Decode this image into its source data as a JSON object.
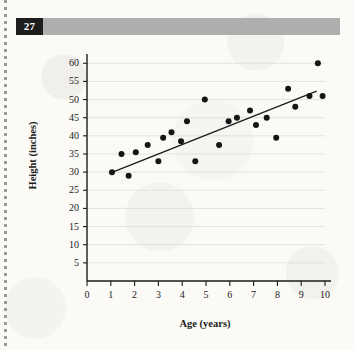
{
  "page": {
    "number": "27"
  },
  "chart_data": {
    "type": "scatter",
    "title": "",
    "xlabel": "Age (years)",
    "ylabel": "Height (inches)",
    "xlim": [
      0,
      10
    ],
    "ylim": [
      0,
      62
    ],
    "xticks": [
      0,
      1,
      2,
      3,
      4,
      5,
      6,
      7,
      8,
      9,
      10
    ],
    "xtick_labels": [
      "0",
      "1",
      "2",
      "3",
      "4",
      "5",
      "6",
      "7",
      "8",
      "9",
      "10"
    ],
    "yticks": [
      5,
      10,
      15,
      20,
      25,
      30,
      35,
      40,
      45,
      50,
      55,
      60
    ],
    "ytick_labels": [
      "5",
      "10",
      "15",
      "20",
      "25",
      "30",
      "35",
      "40",
      "45",
      "50",
      "55",
      "60"
    ],
    "grid": "horizontal",
    "legend": "none",
    "marker_color": "#151515",
    "line_color": "#1a1a1a",
    "axis_color": "#1a1a1a",
    "grid_color": "#d8d8d4",
    "points": [
      {
        "x": 1.05,
        "y": 30.0
      },
      {
        "x": 1.45,
        "y": 35.0
      },
      {
        "x": 1.75,
        "y": 29.0
      },
      {
        "x": 2.05,
        "y": 35.5
      },
      {
        "x": 2.55,
        "y": 37.5
      },
      {
        "x": 3.0,
        "y": 33.0
      },
      {
        "x": 3.2,
        "y": 39.5
      },
      {
        "x": 3.55,
        "y": 41.0
      },
      {
        "x": 3.95,
        "y": 38.5
      },
      {
        "x": 4.2,
        "y": 44.0
      },
      {
        "x": 4.55,
        "y": 33.0
      },
      {
        "x": 4.95,
        "y": 50.0
      },
      {
        "x": 5.55,
        "y": 37.5
      },
      {
        "x": 5.95,
        "y": 44.0
      },
      {
        "x": 6.3,
        "y": 45.0
      },
      {
        "x": 6.85,
        "y": 47.0
      },
      {
        "x": 7.1,
        "y": 43.0
      },
      {
        "x": 7.55,
        "y": 45.0
      },
      {
        "x": 7.95,
        "y": 39.5
      },
      {
        "x": 8.45,
        "y": 53.0
      },
      {
        "x": 8.75,
        "y": 48.0
      },
      {
        "x": 9.35,
        "y": 51.0
      },
      {
        "x": 9.7,
        "y": 60.0
      },
      {
        "x": 9.9,
        "y": 51.0
      }
    ],
    "trend_line": {
      "name": "line of best fit",
      "x_start": 1.0,
      "y_start": 29.8,
      "x_end": 9.65,
      "y_end": 52.3
    }
  }
}
